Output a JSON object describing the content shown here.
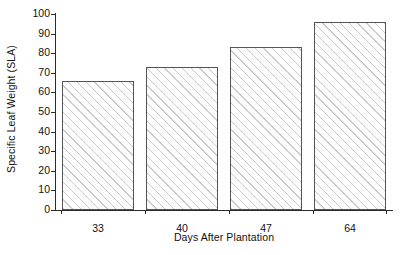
{
  "chart_data": {
    "type": "bar",
    "title": "",
    "xlabel": "Days After Plantation",
    "ylabel": "Specific Leaf Weight (SLA)",
    "categories": [
      "33",
      "40",
      "47",
      "64"
    ],
    "values": [
      66,
      73,
      83,
      96
    ],
    "ylim": [
      0,
      100
    ],
    "ytick_labels": [
      "0",
      "10",
      "20",
      "30",
      "40",
      "50",
      "60",
      "70",
      "80",
      "90",
      "100"
    ],
    "ytick_values": [
      0,
      10,
      20,
      30,
      40,
      50,
      60,
      70,
      80,
      90,
      100
    ],
    "grid": false,
    "legend": false,
    "legend_position": "none",
    "series": [
      {
        "name": "Specific Leaf Weight (SLA)",
        "values": [
          66,
          73,
          83,
          96
        ]
      }
    ],
    "bar_style": {
      "fill": "#fdfdfd",
      "hatch": "diagonal-forward",
      "hatch_color": "#787878",
      "edge_color": "#555555"
    },
    "background_color": "#ffffff",
    "axis_color": "#2b2b2b"
  }
}
